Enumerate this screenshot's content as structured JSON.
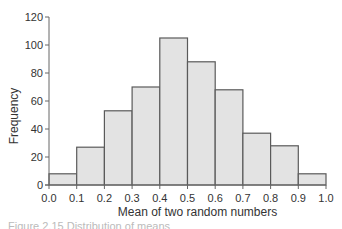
{
  "chart_data": {
    "type": "bar",
    "subtype": "histogram",
    "title": "",
    "xlabel": "Mean of two random numbers",
    "ylabel": "Frequency",
    "bin_edges": [
      0.0,
      0.1,
      0.2,
      0.3,
      0.4,
      0.5,
      0.6,
      0.7,
      0.8,
      0.9,
      1.0
    ],
    "categories": [
      "0.0-0.1",
      "0.1-0.2",
      "0.2-0.3",
      "0.3-0.4",
      "0.4-0.5",
      "0.5-0.6",
      "0.6-0.7",
      "0.7-0.8",
      "0.8-0.9",
      "0.9-1.0"
    ],
    "values": [
      8,
      27,
      53,
      70,
      105,
      88,
      68,
      37,
      28,
      8
    ],
    "xticks": [
      "0.0",
      "0.1",
      "0.2",
      "0.3",
      "0.4",
      "0.5",
      "0.6",
      "0.7",
      "0.8",
      "0.9",
      "1.0"
    ],
    "yticks": [
      "0",
      "20",
      "40",
      "60",
      "80",
      "100",
      "120"
    ],
    "xlim": [
      0.0,
      1.0
    ],
    "ylim": [
      0,
      120
    ],
    "grid": false,
    "legend": null,
    "colors": {
      "bar_fill": "#e3e3e3",
      "bar_edge": "#5a5a5a",
      "axis": "#666666"
    }
  },
  "caption": "Figure 2.15 Distribution of means"
}
